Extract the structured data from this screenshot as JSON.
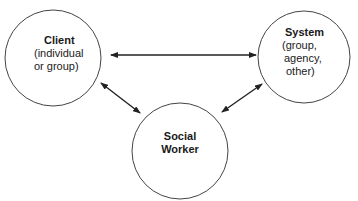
{
  "diagram": {
    "nodes": [
      {
        "id": "client",
        "title": "Client",
        "lines": [
          "(individual",
          "or group)"
        ]
      },
      {
        "id": "system",
        "title": "System",
        "lines": [
          "(group,",
          "agency,",
          "other)"
        ]
      },
      {
        "id": "social_worker",
        "title_lines": [
          "Social",
          "Worker"
        ]
      }
    ],
    "edges": [
      {
        "from": "client",
        "to": "system",
        "type": "bidirectional"
      },
      {
        "from": "client",
        "to": "social_worker",
        "type": "bidirectional"
      },
      {
        "from": "system",
        "to": "social_worker",
        "type": "bidirectional"
      }
    ],
    "colors": {
      "stroke": "#333333",
      "text": "#1a1a1a",
      "background": "#ffffff"
    }
  }
}
